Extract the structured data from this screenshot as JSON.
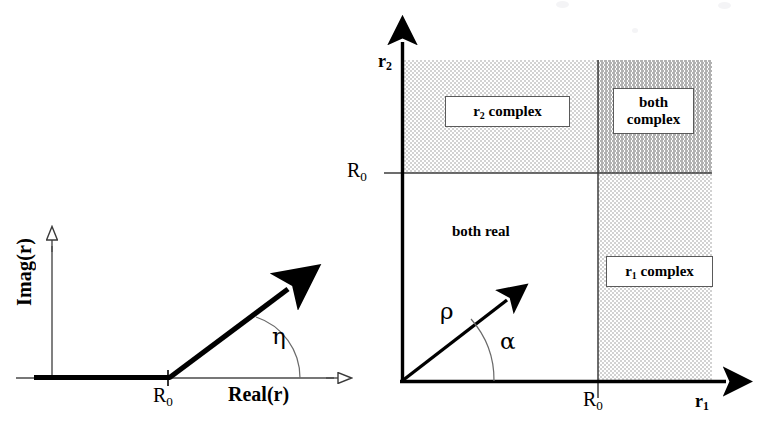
{
  "figure": {
    "title_none": "",
    "left_panel": {
      "name": "complex-root-locus-panel",
      "axes": {
        "y_label": "Imag(r)",
        "x_label": "Real(r)",
        "x_tick_label": "R",
        "x_tick_sub": "0"
      },
      "angle_label": "η",
      "ray_description": "bold ray from R0 rising at angle eta",
      "real_segment_description": "bold segment along real axis from origin to R0"
    },
    "right_panel": {
      "name": "r1-r2-region-map-panel",
      "axes": {
        "y_label": "r",
        "y_label_sub": "2",
        "x_label": "r",
        "x_label_sub": "1",
        "y_tick_label": "R",
        "y_tick_sub": "0",
        "x_tick_label": "R",
        "x_tick_sub": "0"
      },
      "regions": [
        {
          "id": "r2-complex",
          "label": "r",
          "label_sub": "2",
          "label_rest": " complex",
          "boxed": true,
          "shade": "light"
        },
        {
          "id": "both-complex",
          "line1": "both",
          "line2": "complex",
          "boxed": true,
          "shade": "dark"
        },
        {
          "id": "both-real",
          "label_plain": "both real",
          "boxed": false,
          "shade": "none"
        },
        {
          "id": "r1-complex",
          "label": "r",
          "label_sub": "1",
          "label_rest": " complex",
          "boxed": true,
          "shade": "light"
        }
      ],
      "vector_label": "ρ",
      "angle_label": "α"
    },
    "colors": {
      "ink": "#000000",
      "thin_rule": "#4a4a4a",
      "shade_light": "#e3e3e3",
      "shade_dark": "#c9c9c9",
      "box_border": "#5a5a5a",
      "background": "#ffffff"
    }
  }
}
